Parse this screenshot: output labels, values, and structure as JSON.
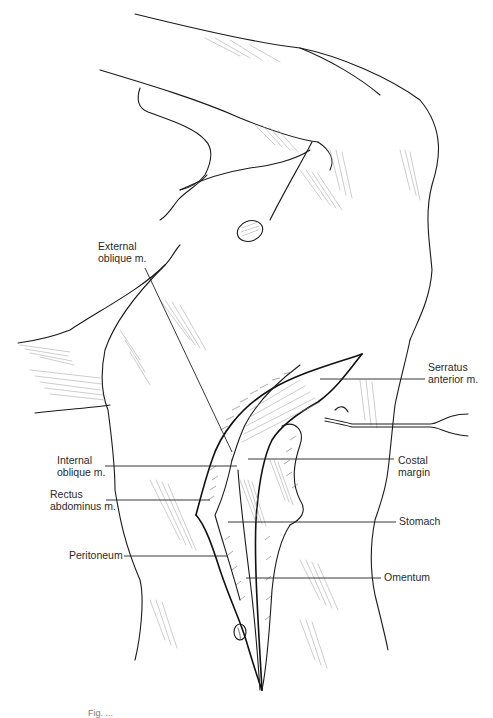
{
  "figure": {
    "caption_cutoff": "Fig. ...",
    "labels": [
      {
        "id": "external-oblique",
        "text": "External\noblique m.",
        "x": 98,
        "y": 241,
        "anchor": "left",
        "leader": [
          [
            145,
            268
          ],
          [
            232,
            452
          ]
        ]
      },
      {
        "id": "serratus-anterior",
        "text": "Serratus\nanterior m.",
        "x": 428,
        "y": 362,
        "anchor": "left",
        "leader": [
          [
            320,
            379
          ],
          [
            425,
            379
          ]
        ]
      },
      {
        "id": "internal-oblique",
        "text": "Internal\noblique m.",
        "x": 57,
        "y": 455,
        "anchor": "left",
        "leader": [
          [
            105,
            466
          ],
          [
            237,
            466
          ]
        ]
      },
      {
        "id": "costal-margin",
        "text": "Costal\nmargin",
        "x": 398,
        "y": 455,
        "anchor": "left",
        "leader": [
          [
            248,
            459
          ],
          [
            394,
            459
          ]
        ]
      },
      {
        "id": "rectus-abdominus",
        "text": "Rectus\nabdominus m.",
        "x": 50,
        "y": 489,
        "anchor": "left",
        "leader": [
          [
            106,
            500
          ],
          [
            210,
            500
          ]
        ]
      },
      {
        "id": "stomach",
        "text": "Stomach",
        "x": 399,
        "y": 516,
        "anchor": "left",
        "leader": [
          [
            228,
            522
          ],
          [
            396,
            522
          ]
        ]
      },
      {
        "id": "peritoneum",
        "text": "Peritoneum",
        "x": 69,
        "y": 550,
        "anchor": "left",
        "leader": [
          [
            124,
            556
          ],
          [
            228,
            556
          ]
        ]
      },
      {
        "id": "omentum",
        "text": "Omentum",
        "x": 384,
        "y": 572,
        "anchor": "left",
        "leader": [
          [
            246,
            578
          ],
          [
            381,
            578
          ]
        ]
      }
    ]
  },
  "colors": {
    "background": "#ffffff",
    "ink": "#1a1a1a",
    "label_text": "#2a2a2a"
  }
}
